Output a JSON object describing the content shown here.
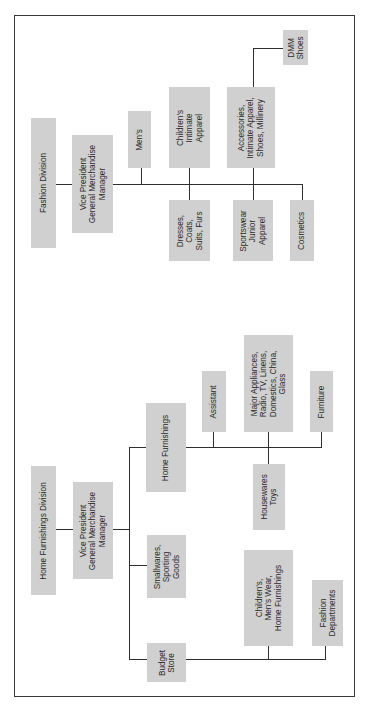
{
  "fashion": {
    "division": "Fashion Division",
    "vp": "Vice President\nGeneral Merchandise\nManager",
    "mens": "Men's",
    "childrens_intimate": "Children's\nIntimate\nApparel",
    "accessories": "Accessories,\nIntimate Apparel,\nShoes, Millinery",
    "dmm_shoes": "DMM\nShoes",
    "dresses": "Dresses,\nCoats,\nSuits, Furs",
    "sportswear": "Sportswear\nJunior\nApparel",
    "cosmetics": "Cosmetics"
  },
  "home": {
    "division": "Home Furnishings Division",
    "vp": "Vice President\nGeneral Merchandise\nManager",
    "home_furnishings": "Home Furnishings",
    "assistant": "Assistant",
    "major_appliances": "Major Appliances,\nRadio, TV, Linens,\nDomestics, China,\nGlass",
    "furniture": "Furniture",
    "housewares": "Housewares\nToys",
    "smallwares": "Smallwares,\nSporting\nGoods",
    "budget_store": "Budget\nStore",
    "childrens_mens_home": "Children's,\nMen's Wear,\nHome Furnishings",
    "fashion_departments": "Fashion\nDepartments"
  },
  "colors": {
    "box_fill": "#d0d0d0",
    "line": "#2e2e2e",
    "text": "#2a2a2a"
  }
}
